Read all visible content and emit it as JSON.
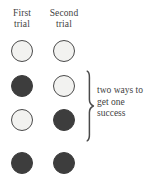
{
  "figure": {
    "name": "two-trial outcome diagram",
    "background_color": "#ffffff",
    "ink_color": "#3d3d3d",
    "open_fill_color": "#f2f2f0",
    "filled_color": "#3d3d3d"
  },
  "columns": [
    {
      "id": "first-trial",
      "line1": "First",
      "line2": "trial"
    },
    {
      "id": "second-trial",
      "line1": "Second",
      "line2": "trial"
    }
  ],
  "rows": [
    {
      "id": "row-1",
      "first": "open",
      "second": "open",
      "successes": 0
    },
    {
      "id": "row-2",
      "first": "filled",
      "second": "open",
      "successes": 1
    },
    {
      "id": "row-3",
      "first": "open",
      "second": "filled",
      "successes": 1
    },
    {
      "id": "row-4",
      "first": "filled",
      "second": "filled",
      "successes": 2
    }
  ],
  "annotation": {
    "line1": "two ways to",
    "line2": "get one",
    "line3": "success",
    "full_text": "two ways to get one success",
    "brackets_rows": [
      "row-2",
      "row-3"
    ]
  },
  "chart_data": {
    "type": "table",
    "title": "",
    "categories": [
      "First trial",
      "Second trial"
    ],
    "legend": [
      "open = failure",
      "filled = success"
    ],
    "rows": [
      {
        "first_trial": "open",
        "second_trial": "open",
        "number_of_successes": 0
      },
      {
        "first_trial": "filled",
        "second_trial": "open",
        "number_of_successes": 1
      },
      {
        "first_trial": "open",
        "second_trial": "filled",
        "number_of_successes": 1
      },
      {
        "first_trial": "filled",
        "second_trial": "filled",
        "number_of_successes": 2
      }
    ],
    "annotations": [
      "two ways to get one success"
    ]
  }
}
